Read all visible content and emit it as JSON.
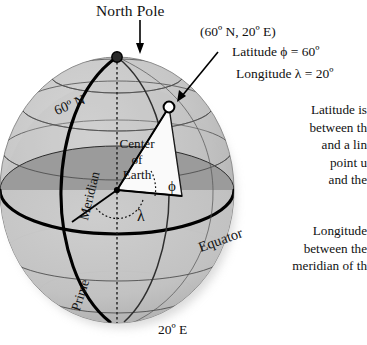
{
  "figure": {
    "type": "diagram",
    "north_pole_label": "North Pole",
    "coordinate_label": "(60º N, 20º E)",
    "latitude_value_label": "Latitude ϕ = 60º",
    "longitude_value_label": "Longitude λ = 20º",
    "bottom_meridian_label": "20º E",
    "parallel_label": "60º N",
    "meridian_label": "Meridian",
    "prime_label": "Prime",
    "equator_label": "Equator",
    "center_lines": [
      "Center",
      "of",
      "Earth"
    ],
    "phi_symbol": "ϕ",
    "lambda_symbol": "λ",
    "latitude_paragraph": [
      "Latitude is",
      "between th",
      "and a lin",
      "point u",
      "and the"
    ],
    "longitude_paragraph": [
      "Longitude",
      "between the",
      "meridian of th"
    ]
  },
  "colors": {
    "sphere_light": "#c6c6c6",
    "sphere_mid": "#b3b3b3",
    "sphere_dark": "#9a9a9a",
    "equator_plane": "#9d9d9d",
    "wedge": "#fbfbfb",
    "line": "#3a3a3a",
    "bold_line": "#000000",
    "text": "#111111",
    "background": "#ffffff"
  }
}
